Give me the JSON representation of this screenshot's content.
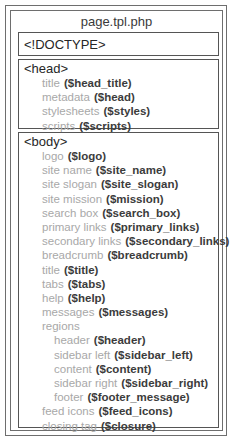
{
  "title": "page.tpl.php",
  "doctype": {
    "tag": "<!DOCTYPE>"
  },
  "head": {
    "tag": "<head>",
    "items": [
      {
        "label": "title",
        "var": "($head_title)"
      },
      {
        "label": "metadata",
        "var": "($head)"
      },
      {
        "label": "stylesheets",
        "var": "($styles)"
      },
      {
        "label": "scripts",
        "var": "($scripts)"
      }
    ]
  },
  "body": {
    "tag": "<body>",
    "items": [
      {
        "label": "logo",
        "var": "($logo)"
      },
      {
        "label": "site name",
        "var": "($site_name)"
      },
      {
        "label": "site slogan",
        "var": "($site_slogan)"
      },
      {
        "label": "site mission",
        "var": "($mission)"
      },
      {
        "label": "search box",
        "var": "($search_box)"
      },
      {
        "label": "primary links",
        "var": "($primary_links)"
      },
      {
        "label": "secondary links",
        "var": "($secondary_links)"
      },
      {
        "label": "breadcrumb",
        "var": "($breadcrumb)"
      },
      {
        "label": "title",
        "var": "($title)"
      },
      {
        "label": "tabs",
        "var": "($tabs)"
      },
      {
        "label": "help",
        "var": "($help)"
      },
      {
        "label": "messages",
        "var": "($messages)"
      },
      {
        "label": "regions",
        "var": ""
      },
      {
        "label": "feed icons",
        "var": "($feed_icons)"
      },
      {
        "label": "closing tag",
        "var": "($closure)"
      }
    ],
    "regions": [
      {
        "label": "header",
        "var": "($header)"
      },
      {
        "label": "sidebar left",
        "var": "($sidebar_left)"
      },
      {
        "label": "content",
        "var": "($content)"
      },
      {
        "label": "sidebar right",
        "var": "($sidebar_right)"
      },
      {
        "label": "footer",
        "var": "($footer_message)"
      }
    ]
  }
}
